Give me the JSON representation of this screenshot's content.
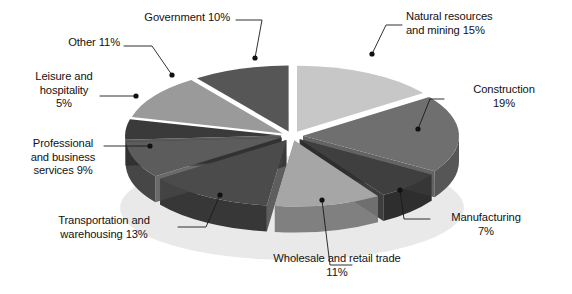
{
  "chart_data": {
    "type": "pie",
    "title": "",
    "subtitle": "",
    "xlabel": "",
    "ylabel": "",
    "legend_position": "none",
    "grid": false,
    "style": "3d-exploded-pie",
    "unit": "%",
    "categories": [
      "Natural resources and mining",
      "Construction",
      "Manufacturing",
      "Wholesale and retail trade",
      "Transportation and warehousing",
      "Professional and business services",
      "Leisure and hospitality",
      "Other",
      "Government"
    ],
    "values": [
      15,
      19,
      7,
      11,
      13,
      9,
      5,
      11,
      10
    ],
    "slices": [
      {
        "label": "Natural resources and mining",
        "value": 15,
        "color": "#c7c7c7",
        "side_color": "#a8a8a8"
      },
      {
        "label": "Construction",
        "value": 19,
        "color": "#6f6f6f",
        "side_color": "#565656"
      },
      {
        "label": "Manufacturing",
        "value": 7,
        "color": "#3f3f3f",
        "side_color": "#2e2e2e"
      },
      {
        "label": "Wholesale and retail trade",
        "value": 11,
        "color": "#a6a6a6",
        "side_color": "#808080"
      },
      {
        "label": "Transportation and warehousing",
        "value": 13,
        "color": "#4b4b4b",
        "side_color": "#373737"
      },
      {
        "label": "Professional and business services",
        "value": 9,
        "color": "#5c5c5c",
        "side_color": "#464646"
      },
      {
        "label": "Leisure and hospitality",
        "value": 5,
        "color": "#3a3a3a",
        "side_color": "#2b2b2b"
      },
      {
        "label": "Other",
        "value": 11,
        "color": "#9a9a9a",
        "side_color": "#787878"
      },
      {
        "label": "Government",
        "value": 10,
        "color": "#565656",
        "side_color": "#3f3f3f"
      }
    ]
  },
  "labels": {
    "government": {
      "text": "Government 10%",
      "name": "Government",
      "percent": "10%"
    },
    "other": {
      "text": "Other 11%",
      "name": "Other",
      "percent": "11%"
    },
    "leisure": {
      "text": "Leisure and\nhospitality\n5%",
      "name": "Leisure and hospitality",
      "percent": "5%"
    },
    "professional": {
      "text": "Professional\nand business\nservices 9%",
      "name": "Professional and business services",
      "percent": "9%"
    },
    "transportation": {
      "text": "Transportation and\nwarehousing 13%",
      "name": "Transportation and warehousing",
      "percent": "13%"
    },
    "wholesale": {
      "text": "Wholesale and retail trade\n11%",
      "name": "Wholesale and retail trade",
      "percent": "11%"
    },
    "manufacturing": {
      "text": "Manufacturing\n7%",
      "name": "Manufacturing",
      "percent": "7%"
    },
    "construction": {
      "text": "Construction\n19%",
      "name": "Construction",
      "percent": "19%"
    },
    "natural": {
      "text": "Natural resources\nand mining 15%",
      "name": "Natural resources and mining",
      "percent": "15%"
    }
  },
  "colors": {
    "background": "#ffffff",
    "text": "#121212",
    "leader_line": "#1a1a1a",
    "slice_gap": "#ffffff"
  }
}
